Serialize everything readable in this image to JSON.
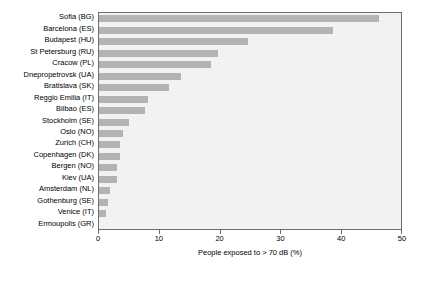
{
  "chart_data": {
    "type": "bar",
    "orientation": "horizontal",
    "title": "",
    "xlabel": "People exposed to > 70 dB (%)",
    "ylabel": "",
    "xlim": [
      0,
      50
    ],
    "xticks": [
      0,
      10,
      20,
      30,
      40,
      50
    ],
    "grid": false,
    "legend": null,
    "bar_color": "#b3b3b3",
    "plot_background": "#f2f2f2",
    "categories": [
      "Sofia (BG)",
      "Barcelona (ES)",
      "Budapest (HU)",
      "St Petersburg (RU)",
      "Cracow (PL)",
      "Dnepropetrovsk (UA)",
      "Bratislava (SK)",
      "Reggio Emilia (IT)",
      "Bilbao (ES)",
      "Stockholm (SE)",
      "Oslo (NO)",
      "Zurich (CH)",
      "Copenhagen (DK)",
      "Bergen (NO)",
      "Kiev (UA)",
      "Amsterdam (NL)",
      "Gothenburg (SE)",
      "Venice (IT)",
      "Ermoupolis (GR)"
    ],
    "values": [
      46.0,
      38.5,
      24.5,
      19.5,
      18.5,
      13.5,
      11.5,
      8.0,
      7.5,
      5.0,
      4.0,
      3.5,
      3.5,
      3.0,
      3.0,
      1.8,
      1.5,
      1.2,
      0.0
    ]
  }
}
